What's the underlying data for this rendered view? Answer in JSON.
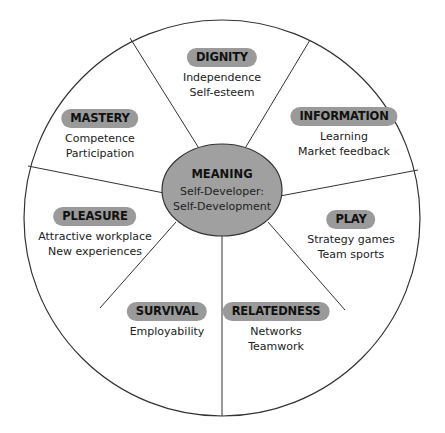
{
  "diagram": {
    "type": "wheel",
    "center": {
      "title": "MEANING",
      "line1": "Self-Developer:",
      "line2": "Self-Development"
    },
    "segments": [
      {
        "label": "DIGNITY",
        "items": [
          "Independence",
          "Self-esteem"
        ]
      },
      {
        "label": "INFORMATION",
        "items": [
          "Learning",
          "Market feedback"
        ]
      },
      {
        "label": "PLAY",
        "items": [
          "Strategy games",
          "Team sports"
        ]
      },
      {
        "label": "RELATEDNESS",
        "items": [
          "Networks",
          "Teamwork"
        ]
      },
      {
        "label": "SURVIVAL",
        "items": [
          "Employability"
        ]
      },
      {
        "label": "PLEASURE",
        "items": [
          "Attractive workplace",
          "New experiences"
        ]
      },
      {
        "label": "MASTERY",
        "items": [
          "Competence",
          "Participation"
        ]
      }
    ],
    "colors": {
      "pill_fill": "#9a9a9a",
      "center_fill": "#a0a0a0",
      "line": "#333333"
    }
  }
}
